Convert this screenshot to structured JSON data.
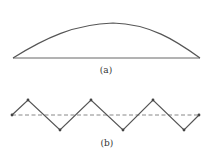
{
  "figure_a": {
    "label": "(a)",
    "description": "single arch curve over baseline",
    "baseline": {
      "x1": 13,
      "x2": 200,
      "y": 58
    },
    "arch_peak": {
      "x": 113,
      "y": 23
    },
    "stroke_color": "#555555"
  },
  "figure_b": {
    "label": "(b)",
    "description": "zigzag polyline crossing dashed midline",
    "zigzag_points": [
      [
        12,
        115
      ],
      [
        28,
        100
      ],
      [
        60,
        130
      ],
      [
        91,
        100
      ],
      [
        123,
        130
      ],
      [
        153,
        100
      ],
      [
        184,
        130
      ],
      [
        199,
        115
      ]
    ],
    "midline": {
      "x1": 12,
      "x2": 199,
      "y": 115,
      "style": "dashed"
    },
    "stroke_color": "#555555",
    "dash_color": "#888888"
  }
}
